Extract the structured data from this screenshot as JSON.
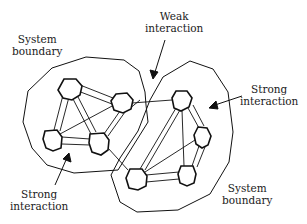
{
  "diagram": {
    "type": "system-interaction-network",
    "labels": {
      "system_boundary_left": [
        "System",
        "boundary"
      ],
      "weak_interaction": [
        "Weak",
        "interaction"
      ],
      "strong_interaction_right": [
        "Strong",
        "interaction"
      ],
      "strong_interaction_left": [
        "Strong",
        "interaction"
      ],
      "system_boundary_right": [
        "System",
        "boundary"
      ]
    },
    "systems": [
      {
        "name": "left-system",
        "node_count": 4,
        "nodes": [
          {
            "id": "L1",
            "x": 70,
            "y": 87
          },
          {
            "id": "L2",
            "x": 123,
            "y": 102
          },
          {
            "id": "L3",
            "x": 52,
            "y": 140
          },
          {
            "id": "L4",
            "x": 99,
            "y": 142
          }
        ]
      },
      {
        "name": "right-system",
        "node_count": 4,
        "nodes": [
          {
            "id": "R1",
            "x": 182,
            "y": 100
          },
          {
            "id": "R2",
            "x": 203,
            "y": 137
          },
          {
            "id": "R3",
            "x": 136,
            "y": 178
          },
          {
            "id": "R4",
            "x": 188,
            "y": 175
          }
        ]
      }
    ],
    "interactions": {
      "strong": [
        "L1-L2",
        "L1-L3",
        "L1-L4",
        "L2-L3",
        "L2-L4",
        "L3-L4",
        "R1-R2",
        "R1-R3",
        "R1-R4",
        "R2-R3",
        "R2-R4",
        "R3-R4"
      ],
      "weak": [
        "L2-R1",
        "L4-R3",
        "L2-R3"
      ]
    },
    "colors": {
      "stroke": "#111111",
      "text": "#1a1a1a",
      "background": "#ffffff"
    }
  }
}
